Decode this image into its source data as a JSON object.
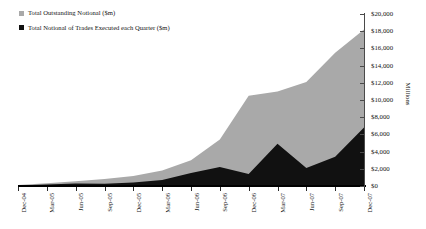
{
  "chart_data": {
    "type": "area",
    "title": "",
    "subtitle": "",
    "xlabel": "",
    "ylabel": "Millions",
    "ylim": [
      0,
      20000
    ],
    "ytick_step": 2000,
    "grid": false,
    "legend_position": "top-left",
    "overlap_mode": "overlapping-areas",
    "categories": [
      "Dec-04",
      "Mar-05",
      "Jun-05",
      "Sep-05",
      "Dec-05",
      "Mar-06",
      "Jun-06",
      "Sep-06",
      "Dec-06",
      "Mar-07",
      "Jun-07",
      "Sep-07",
      "Dec-07"
    ],
    "ytick_labels": [
      "$20,000",
      "$18,000",
      "$16,000",
      "$14,000",
      "$12,000",
      "$10,000",
      "$8,000",
      "$6,000",
      "$4,000",
      "$2,000",
      "$0"
    ],
    "ytick_values": [
      20000,
      18000,
      16000,
      14000,
      12000,
      10000,
      8000,
      6000,
      4000,
      2000,
      0
    ],
    "series": [
      {
        "name": "Total Outstanding Notional ($m)",
        "color": "#a9a9a9",
        "values": [
          120,
          330,
          560,
          800,
          1150,
          1800,
          3000,
          5400,
          10500,
          11000,
          12100,
          15500,
          18200
        ]
      },
      {
        "name": "Total Notional of Trades Executed each Quarter ($m)",
        "color": "#111111",
        "values": [
          60,
          180,
          300,
          260,
          420,
          700,
          1500,
          2200,
          1400,
          4900,
          2100,
          3400,
          6800
        ]
      }
    ]
  },
  "legend": {
    "entries": [
      {
        "label": "Total Outstanding Notional ($m)",
        "marker": "gray-square-marker",
        "color": "#a9a9a9"
      },
      {
        "label": "Total Notional of Trades Executed each Quarter ($m)",
        "marker": "black-square-marker",
        "color": "#111111"
      }
    ]
  },
  "axis": {
    "y_right_title": "Millions"
  }
}
